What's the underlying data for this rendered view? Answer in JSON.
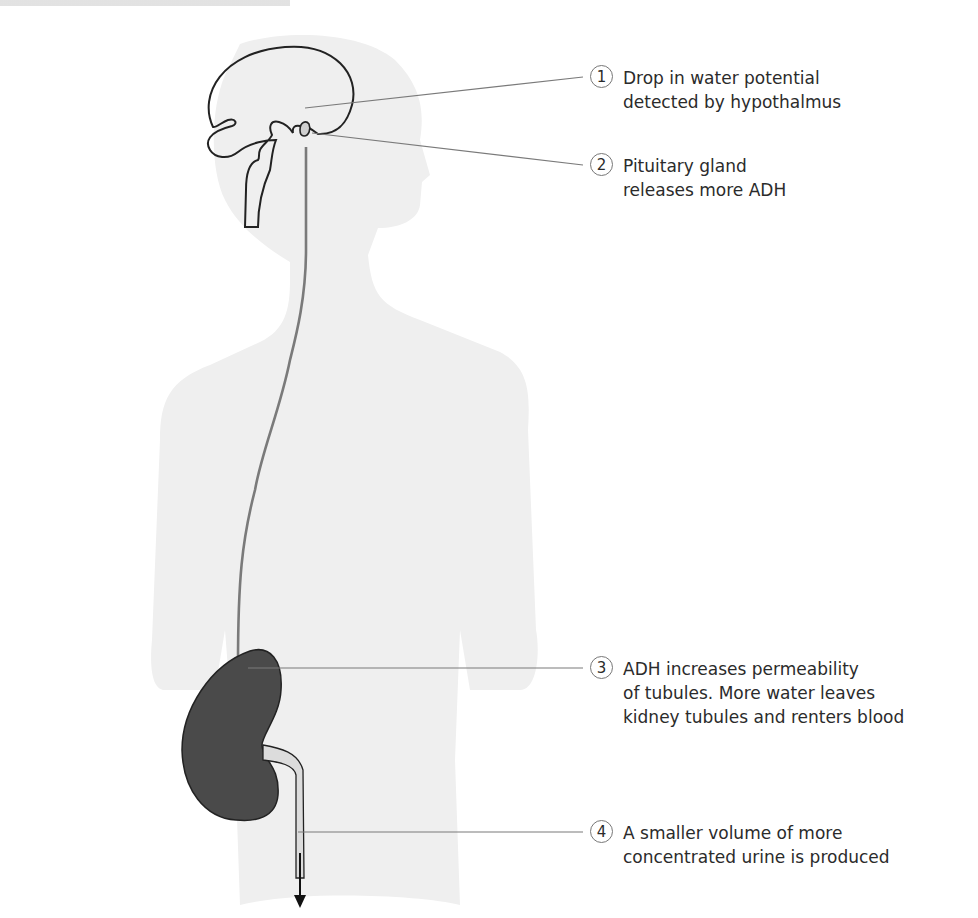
{
  "figure": {
    "colors": {
      "background": "#ffffff",
      "silhouette": "#efefef",
      "outline": "#222222",
      "hormone_path": "#7a7a7a",
      "kidney": "#4a4a4a",
      "leader_line": "#7a7a7a",
      "text": "#2b2b2b"
    },
    "labels": [
      {
        "number": "1",
        "lines": [
          "Drop in water potential",
          "detected by hypothalmus"
        ]
      },
      {
        "number": "2",
        "lines": [
          "Pituitary gland",
          "releases more ADH"
        ]
      },
      {
        "number": "3",
        "lines": [
          "ADH increases permeability",
          "of tubules. More water leaves",
          "kidney tubules and renters blood"
        ]
      },
      {
        "number": "4",
        "lines": [
          "A smaller volume of more",
          "concentrated urine is produced"
        ]
      }
    ]
  }
}
